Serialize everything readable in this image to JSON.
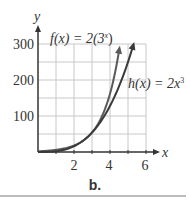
{
  "chart_data": {
    "type": "line",
    "title": "",
    "caption": "b.",
    "xlabel": "x",
    "ylabel": "y",
    "xlim": [
      0,
      6
    ],
    "ylim": [
      0,
      300
    ],
    "xticks": [
      2,
      4,
      6
    ],
    "xtick_labels": [
      "2",
      "4",
      "6"
    ],
    "yticks": [
      100,
      200,
      300
    ],
    "ytick_labels": [
      "100",
      "200",
      "300"
    ],
    "grid": true,
    "grid_x_step": 1,
    "grid_y_step": 50,
    "legend": "inline annotations",
    "series": [
      {
        "name": "f(x) = 2(3^x)",
        "label_text": "f(x) = 2(3",
        "label_sup": "x",
        "label_close": ")",
        "formula": "2*3^x",
        "x": [
          0,
          1,
          2,
          3,
          3.5,
          4,
          4.25,
          4.5
        ],
        "values": [
          2,
          6,
          18,
          54,
          93.5,
          162,
          213.4,
          280.6
        ],
        "arrow_end": true
      },
      {
        "name": "h(x) = 2x^3",
        "label_text": "h(x) = 2x",
        "label_sup": "3",
        "label_close": "",
        "formula": "2*x^3",
        "x": [
          0,
          1,
          2,
          3,
          4,
          4.5,
          5,
          5.3
        ],
        "values": [
          0,
          2,
          16,
          54,
          128,
          182.3,
          250,
          297.8
        ],
        "arrow_end": true
      }
    ]
  },
  "colors": {
    "grid": "#c8c8c8",
    "axis": "#333333",
    "curve_f": "#5a5a5a",
    "curve_h": "#3a3a3a",
    "separator": "#bdbdbd"
  }
}
